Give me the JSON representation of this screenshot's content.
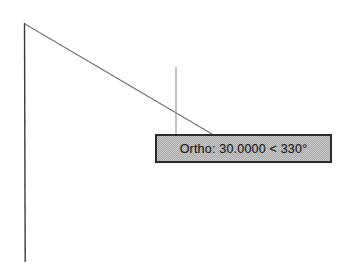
{
  "app": {
    "background_color": "#ffffff",
    "canvas_width": 357,
    "canvas_height": 273
  },
  "tooltip": {
    "text": "Ortho: 30.0000 < 330°",
    "mode_label": "Ortho",
    "distance": "30.0000",
    "angle": "330°",
    "separator": "<",
    "background_color": "#ababab",
    "border_color": "#2b2b2b",
    "text_color": "#1e1e1e",
    "x": 155,
    "y": 134,
    "width": 177,
    "height": 29
  },
  "geometry": {
    "vertical_line": {
      "name": "existing-vertical-line",
      "x1": 24,
      "y1": 23,
      "x2": 25,
      "y2": 262,
      "color": "#3a3a3a",
      "width": 1.3,
      "style": "solid"
    },
    "rubber_band_line": {
      "name": "rubber-band-line",
      "x1": 25,
      "y1": 24,
      "x2": 212,
      "y2": 134,
      "color": "#6e6e6e",
      "width": 1,
      "style": "solid"
    },
    "crosshair_vertical": {
      "name": "crosshair-vertical-line",
      "x1": 176,
      "y1": 67,
      "x2": 176,
      "y2": 136,
      "color": "#8a8a8a",
      "width": 1,
      "style": "solid"
    },
    "intersection_point": {
      "x": 176,
      "y": 115
    }
  }
}
